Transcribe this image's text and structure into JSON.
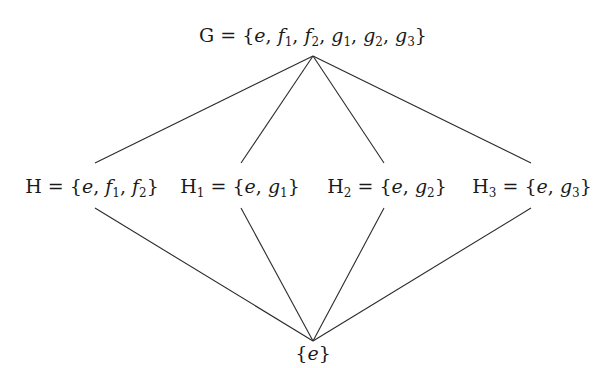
{
  "diagram": {
    "type": "subgroup-lattice",
    "nodes": [
      {
        "id": "G",
        "name": "G",
        "sub": "",
        "elements": [
          "e",
          "f1",
          "f2",
          "g1",
          "g2",
          "g3"
        ],
        "x": 313,
        "y": 22
      },
      {
        "id": "H",
        "name": "H",
        "sub": "",
        "elements": [
          "e",
          "f1",
          "f2"
        ],
        "x": 95,
        "y": 176
      },
      {
        "id": "H1",
        "name": "H",
        "sub": "1",
        "elements": [
          "e",
          "g1"
        ],
        "x": 241,
        "y": 176
      },
      {
        "id": "H2",
        "name": "H",
        "sub": "2",
        "elements": [
          "e",
          "g2"
        ],
        "x": 384,
        "y": 176
      },
      {
        "id": "H3",
        "name": "H",
        "sub": "3",
        "elements": [
          "e",
          "g3"
        ],
        "x": 531,
        "y": 176
      },
      {
        "id": "E",
        "name": "",
        "sub": "",
        "elements": [
          "e"
        ],
        "x": 313,
        "y": 310
      }
    ],
    "edges": [
      {
        "from": "G",
        "to": "H"
      },
      {
        "from": "G",
        "to": "H1"
      },
      {
        "from": "G",
        "to": "H2"
      },
      {
        "from": "G",
        "to": "H3"
      },
      {
        "from": "H",
        "to": "E"
      },
      {
        "from": "H1",
        "to": "E"
      },
      {
        "from": "H2",
        "to": "E"
      },
      {
        "from": "H3",
        "to": "E"
      }
    ],
    "labels": {
      "G": "G = {e, f1, f2, g1, g2, g3}",
      "H": "H = {e, f1, f2}",
      "H1": "H1 = {e, g1}",
      "H2": "H2 = {e, g2}",
      "H3": "H3 = {e, g3}",
      "E": "{e}"
    },
    "line_color": "#2b2b2b"
  }
}
